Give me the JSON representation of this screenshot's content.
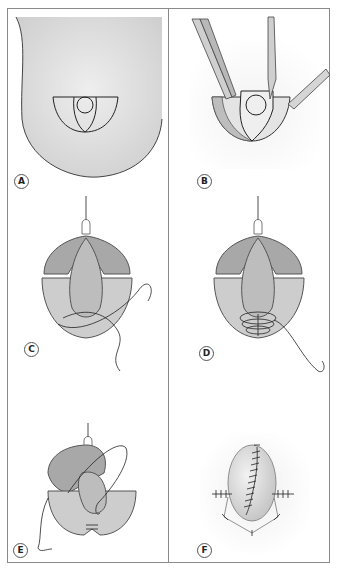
{
  "figure": {
    "panels": [
      {
        "id": "A",
        "label": "A",
        "description": "Breast outline with elliptical incision markings around a circular areola"
      },
      {
        "id": "B",
        "label": "B",
        "description": "Forceps and scalpel retracting and excising the marked skin/tissue wedge"
      },
      {
        "id": "C",
        "label": "C",
        "description": "Areolar flap retracted upward with suture being placed in the lower pedicle"
      },
      {
        "id": "D",
        "label": "D",
        "description": "Purse-string / plicating suture gathering lower tissue"
      },
      {
        "id": "E",
        "label": "E",
        "description": "Pedicle folded with continuous suture being passed"
      },
      {
        "id": "F",
        "label": "F",
        "description": "Final closure with interrupted and running sutures"
      }
    ],
    "colors": {
      "skin": "#dcdcdc",
      "line": "#333333",
      "tissue": "#c9c9c9",
      "tissue_dark": "#9a9a9a",
      "border": "#8a8a8a"
    }
  }
}
